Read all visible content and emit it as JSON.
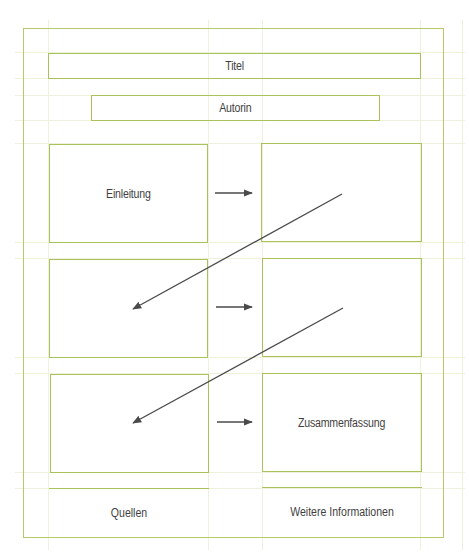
{
  "diagram": {
    "title_label": "Titel",
    "author_label": "Autorin",
    "rows": [
      {
        "left_label": "Einleitung",
        "right_label": ""
      },
      {
        "left_label": "",
        "right_label": ""
      },
      {
        "left_label": "",
        "right_label": "Zusammenfassung"
      }
    ],
    "footer": {
      "left_label": "Quellen",
      "right_label": "Weitere Informationen"
    },
    "colors": {
      "frame": "#b5c96a",
      "box_border": "#a9c25a",
      "grid": "#eef2dc",
      "arrow": "#4a4a4a",
      "text": "#3f3f3f"
    },
    "connectors": [
      {
        "type": "horizontal-arrow",
        "from": "row1-left",
        "to": "row1-right"
      },
      {
        "type": "diagonal-arrow",
        "from": "row1-right",
        "to": "row2-left"
      },
      {
        "type": "horizontal-arrow",
        "from": "row2-left",
        "to": "row2-right"
      },
      {
        "type": "diagonal-arrow",
        "from": "row2-right",
        "to": "row3-left"
      },
      {
        "type": "horizontal-arrow",
        "from": "row3-left",
        "to": "row3-right"
      }
    ]
  }
}
